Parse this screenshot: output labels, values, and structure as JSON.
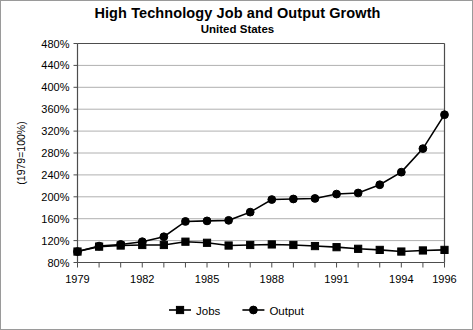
{
  "chart_data": {
    "type": "line",
    "title": "High Technology Job and Output Growth",
    "subtitle": "United States",
    "xlabel": "",
    "ylabel": "(1979=100%)",
    "ylim": [
      80,
      480
    ],
    "ytick_step": 40,
    "ytick_labels": [
      "480%",
      "440%",
      "400%",
      "360%",
      "320%",
      "280%",
      "240%",
      "200%",
      "160%",
      "120%",
      "80%"
    ],
    "ytick_values": [
      480,
      440,
      400,
      360,
      320,
      280,
      240,
      200,
      160,
      120,
      80
    ],
    "grid": true,
    "legend_position": "bottom",
    "x": [
      1979,
      1980,
      1981,
      1982,
      1983,
      1984,
      1985,
      1986,
      1987,
      1988,
      1989,
      1990,
      1991,
      1992,
      1993,
      1994,
      1995,
      1996
    ],
    "xtick_labels": [
      "1979",
      "1982",
      "1985",
      "1988",
      "1991",
      "1994",
      "1996"
    ],
    "xtick_values": [
      1979,
      1982,
      1985,
      1988,
      1991,
      1994,
      1996
    ],
    "series": [
      {
        "name": "Jobs",
        "marker": "square",
        "values": [
          100,
          109,
          111,
          112,
          112,
          118,
          116,
          111,
          112,
          113,
          112,
          110,
          108,
          105,
          103,
          100,
          102,
          103
        ]
      },
      {
        "name": "Output",
        "marker": "circle",
        "values": [
          100,
          110,
          113,
          118,
          127,
          155,
          156,
          157,
          172,
          195,
          196,
          197,
          205,
          207,
          222,
          245,
          288,
          350
        ]
      }
    ]
  },
  "legend": {
    "entries": [
      {
        "label": "Jobs",
        "marker": "square"
      },
      {
        "label": "Output",
        "marker": "circle"
      }
    ]
  },
  "colors": {
    "series": "#000000",
    "grid": "#b0b0b0",
    "axis": "#4d4d4d",
    "background": "#ffffff",
    "border": "#9a9a9a"
  }
}
